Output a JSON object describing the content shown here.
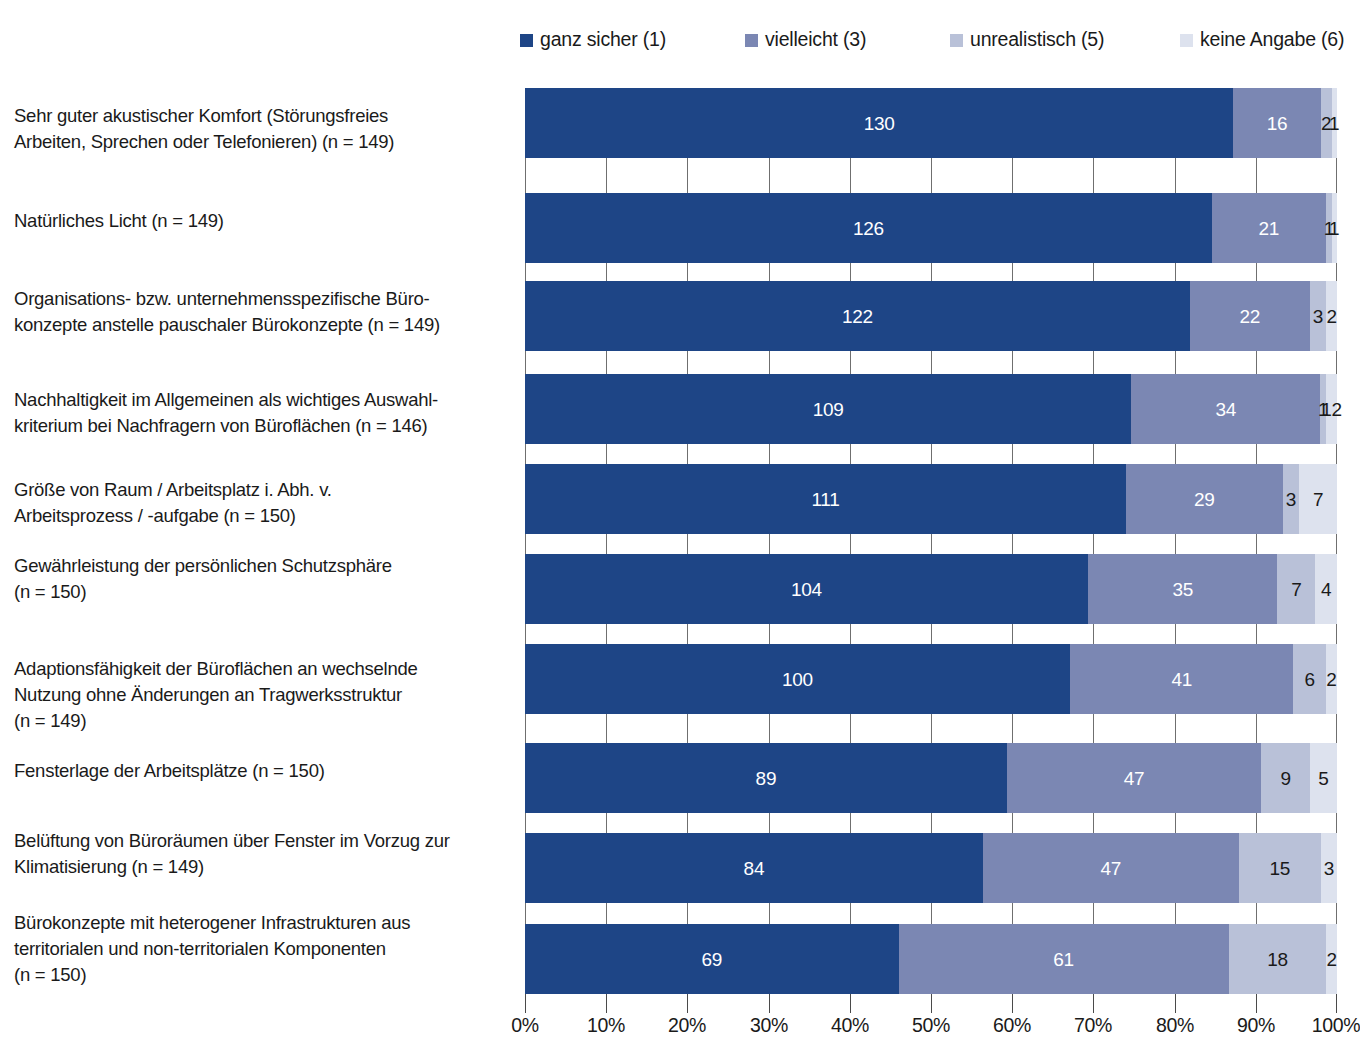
{
  "legend": {
    "items": [
      {
        "label": "ganz sicher (1)",
        "color": "#1e4586",
        "x": 520
      },
      {
        "label": "vielleicht (3)",
        "color": "#7b87b3",
        "x": 745
      },
      {
        "label": "unrealistisch (5)",
        "color": "#b9c1d8",
        "x": 950
      },
      {
        "label": "keine Angabe (6)",
        "color": "#dde2ee",
        "x": 1180
      }
    ]
  },
  "axis": {
    "ticks": [
      "0%",
      "10%",
      "20%",
      "30%",
      "40%",
      "50%",
      "60%",
      "70%",
      "80%",
      "90%",
      "100%"
    ],
    "min": 0,
    "max": 100
  },
  "chart_data": {
    "type": "bar",
    "orientation": "horizontal",
    "stacked": true,
    "normalized": true,
    "title": "",
    "xlabel": "",
    "ylabel": "",
    "xlim": [
      0,
      100
    ],
    "grid": true,
    "legend_position": "top",
    "series": [
      {
        "name": "ganz sicher (1)",
        "color": "#1e4586",
        "values": [
          130,
          126,
          122,
          109,
          111,
          104,
          100,
          89,
          84,
          69
        ]
      },
      {
        "name": "vielleicht (3)",
        "color": "#7b87b3",
        "values": [
          16,
          21,
          22,
          34,
          29,
          35,
          41,
          47,
          47,
          61
        ]
      },
      {
        "name": "unrealistisch (5)",
        "color": "#b9c1d8",
        "values": [
          2,
          1,
          3,
          1,
          3,
          7,
          6,
          9,
          15,
          18
        ]
      },
      {
        "name": "keine Angabe (6)",
        "color": "#dde2ee",
        "values": [
          1,
          1,
          2,
          2,
          7,
          4,
          2,
          5,
          3,
          2
        ]
      }
    ],
    "categories": [
      "Sehr guter akustischer Komfort (Störungsfreies Arbeiten, Sprechen oder Telefonieren) (n = 149)",
      "Natürliches Licht (n = 149)",
      "Organisations- bzw. unternehmensspezifische Büro-konzepte anstelle pauschaler Bürokonzepte (n = 149)",
      "Nachhaltigkeit im Allgemeinen als wichtiges Auswahl-kriterium bei Nachfragern von Büroflächen (n = 146)",
      "Größe von Raum / Arbeitsplatz i. Abh. v. Arbeitsprozess / -aufgabe (n = 150)",
      "Gewährleistung der persönlichen Schutzsphäre (n = 150)",
      "Adaptionsfähigkeit der Büroflächen an wechselnde Nutzung ohne Änderungen an Tragwerksstruktur (n = 149)",
      "Fensterlage der Arbeitsplätze (n = 150)",
      "Belüftung von Büroräumen über Fenster im Vorzug zur Klimatisierung (n = 149)",
      "Bürokonzepte mit heterogener Infrastrukturen aus territorialen und non-territorialen Komponenten (n = 150)"
    ]
  },
  "rows": [
    {
      "label_lines": [
        "Sehr guter akustischer Komfort (Störungsfreies",
        "Arbeiten, Sprechen oder Telefonieren) (n = 149)"
      ],
      "label_top": 103,
      "bar_top": 0,
      "bar_height": 70,
      "total": 149,
      "segments": [
        {
          "value": 130,
          "label": "130"
        },
        {
          "value": 16,
          "label": "16"
        },
        {
          "value": 2,
          "label": "2"
        },
        {
          "value": 1,
          "label": "1"
        }
      ]
    },
    {
      "label_lines": [
        "Natürliches Licht (n = 149)"
      ],
      "label_top": 208,
      "bar_top": 105,
      "bar_height": 70,
      "total": 149,
      "segments": [
        {
          "value": 126,
          "label": "126"
        },
        {
          "value": 21,
          "label": "21"
        },
        {
          "value": 1,
          "label": "1"
        },
        {
          "value": 1,
          "label": "1"
        }
      ]
    },
    {
      "label_lines": [
        "Organisations- bzw. unternehmensspezifische Büro-",
        "konzepte anstelle pauschaler Bürokonzepte (n = 149)"
      ],
      "label_top": 286,
      "bar_top": 193,
      "bar_height": 70,
      "total": 149,
      "segments": [
        {
          "value": 122,
          "label": "122"
        },
        {
          "value": 22,
          "label": "22"
        },
        {
          "value": 3,
          "label": "3"
        },
        {
          "value": 2,
          "label": "2"
        }
      ]
    },
    {
      "label_lines": [
        "Nachhaltigkeit im Allgemeinen als wichtiges Auswahl-",
        "kriterium bei Nachfragern von Büroflächen (n = 146)"
      ],
      "label_top": 387,
      "bar_top": 286,
      "bar_height": 70,
      "total": 146,
      "segments": [
        {
          "value": 109,
          "label": "109"
        },
        {
          "value": 34,
          "label": "34"
        },
        {
          "value": 1,
          "label": "1"
        },
        {
          "value": 2,
          "label": "12"
        }
      ]
    },
    {
      "label_lines": [
        "Größe von Raum / Arbeitsplatz i. Abh. v.",
        "Arbeitsprozess / -aufgabe (n = 150)"
      ],
      "label_top": 477,
      "bar_top": 376,
      "bar_height": 70,
      "total": 150,
      "segments": [
        {
          "value": 111,
          "label": "111"
        },
        {
          "value": 29,
          "label": "29"
        },
        {
          "value": 3,
          "label": "3"
        },
        {
          "value": 7,
          "label": "7"
        }
      ]
    },
    {
      "label_lines": [
        "Gewährleistung der persönlichen Schutzsphäre",
        "(n = 150)"
      ],
      "label_top": 553,
      "bar_top": 466,
      "bar_height": 70,
      "total": 150,
      "segments": [
        {
          "value": 104,
          "label": "104"
        },
        {
          "value": 35,
          "label": "35"
        },
        {
          "value": 7,
          "label": "7"
        },
        {
          "value": 4,
          "label": "4"
        }
      ]
    },
    {
      "label_lines": [
        "Adaptionsfähigkeit der Büroflächen an wechselnde",
        "Nutzung ohne Änderungen an Tragwerksstruktur",
        "(n = 149)"
      ],
      "label_top": 656,
      "bar_top": 556,
      "bar_height": 70,
      "total": 149,
      "segments": [
        {
          "value": 100,
          "label": "100"
        },
        {
          "value": 41,
          "label": "41"
        },
        {
          "value": 6,
          "label": "6"
        },
        {
          "value": 2,
          "label": "2"
        }
      ]
    },
    {
      "label_lines": [
        "Fensterlage der Arbeitsplätze (n = 150)"
      ],
      "label_top": 758,
      "bar_top": 655,
      "bar_height": 70,
      "total": 150,
      "segments": [
        {
          "value": 89,
          "label": "89"
        },
        {
          "value": 47,
          "label": "47"
        },
        {
          "value": 9,
          "label": "9"
        },
        {
          "value": 5,
          "label": "5"
        }
      ]
    },
    {
      "label_lines": [
        "Belüftung von Büroräumen über Fenster im Vorzug zur",
        "Klimatisierung (n = 149)"
      ],
      "label_top": 828,
      "bar_top": 745,
      "bar_height": 70,
      "total": 149,
      "segments": [
        {
          "value": 84,
          "label": "84"
        },
        {
          "value": 47,
          "label": "47"
        },
        {
          "value": 15,
          "label": "15"
        },
        {
          "value": 3,
          "label": "3"
        }
      ]
    },
    {
      "label_lines": [
        "Bürokonzepte mit heterogener Infrastrukturen aus",
        "territorialen und non-territorialen Komponenten",
        "(n = 150)"
      ],
      "label_top": 910,
      "bar_top": 836,
      "bar_height": 70,
      "total": 150,
      "segments": [
        {
          "value": 69,
          "label": "69"
        },
        {
          "value": 61,
          "label": "61"
        },
        {
          "value": 18,
          "label": "18"
        },
        {
          "value": 2,
          "label": "2"
        }
      ]
    }
  ]
}
